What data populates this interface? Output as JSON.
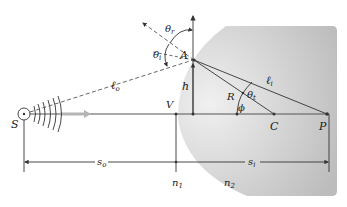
{
  "diagram": {
    "labels": {
      "source": "S",
      "vertex": "V",
      "incidence_point": "A",
      "height": "h",
      "radius": "R",
      "center": "C",
      "image_point": "P",
      "angle_phi": "ϕ",
      "angle_incident": "θ",
      "angle_incident_sub": "i",
      "angle_transmitted": "θ",
      "angle_transmitted_sub": "t",
      "path_object": "ℓ",
      "path_object_sub": "o",
      "path_image": "ℓ",
      "path_image_sub": "i",
      "object_distance": "s",
      "object_distance_sub": "o",
      "image_distance": "s",
      "image_distance_sub": "i",
      "medium1": "n",
      "medium1_sub": "1",
      "medium2": "n",
      "medium2_sub": "2"
    },
    "colors": {
      "lens_fill_dark": "#bdbdbd",
      "lens_fill_light": "#e6e6e6",
      "line": "#333333",
      "dashed": "#555555",
      "arrow_gray": "#b5b5b5"
    }
  }
}
